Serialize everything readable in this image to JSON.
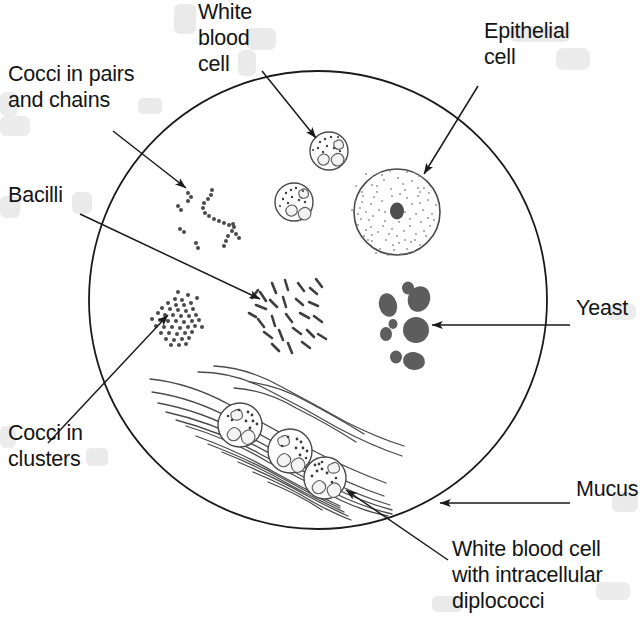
{
  "figure": {
    "kind": "microscopy-smear-diagram",
    "title_visible": false,
    "field_shape": "circle",
    "background_color": "#ffffff",
    "ink_color": "#1a1a1a"
  },
  "labels": [
    {
      "id": "white-blood-cell",
      "lines": [
        "White",
        "blood",
        "cell"
      ],
      "text": "White blood cell",
      "align": "left",
      "x": 198,
      "y": 19,
      "line_height": 26,
      "leader": {
        "from": [
          262,
          71
        ],
        "to": [
          318,
          140
        ],
        "arrow": true
      }
    },
    {
      "id": "cocci-in-pairs-and-chains",
      "lines": [
        "Cocci in pairs",
        "and chains"
      ],
      "text": "Cocci in pairs and chains",
      "align": "left",
      "x": 8,
      "y": 81,
      "line_height": 26,
      "leader": {
        "from": [
          113,
          131
        ],
        "to": [
          188,
          190
        ],
        "arrow": true
      }
    },
    {
      "id": "epithelial-cell",
      "lines": [
        "Epithelial",
        "cell"
      ],
      "text": "Epithelial cell",
      "align": "left",
      "x": 484,
      "y": 38,
      "line_height": 26,
      "leader": {
        "from": [
          478,
          86
        ],
        "to": [
          422,
          176
        ],
        "arrow": true
      }
    },
    {
      "id": "bacilli",
      "lines": [
        "Bacilli"
      ],
      "text": "Bacilli",
      "align": "left",
      "x": 8,
      "y": 202,
      "line_height": 26,
      "leader": {
        "from": [
          80,
          214
        ],
        "to": [
          262,
          300
        ],
        "arrow": true
      }
    },
    {
      "id": "yeast",
      "lines": [
        "Yeast"
      ],
      "text": "Yeast",
      "align": "left",
      "x": 576,
      "y": 315,
      "line_height": 26,
      "leader": {
        "from": [
          570,
          325
        ],
        "to": [
          430,
          325
        ],
        "arrow": true
      }
    },
    {
      "id": "cocci-in-clusters",
      "lines": [
        "Cocci in",
        "clusters"
      ],
      "text": "Cocci in clusters",
      "align": "left",
      "x": 8,
      "y": 440,
      "line_height": 26,
      "leader": {
        "from": [
          48,
          443
        ],
        "to": [
          166,
          313
        ],
        "arrow": true
      }
    },
    {
      "id": "mucus",
      "lines": [
        "Mucus"
      ],
      "text": "Mucus",
      "align": "left",
      "x": 576,
      "y": 496,
      "line_height": 26,
      "leader": {
        "from": [
          570,
          503
        ],
        "to": [
          437,
          503
        ],
        "arrow": true
      }
    },
    {
      "id": "white-blood-cell-with-intracellular-diplococci",
      "lines": [
        "White blood cell",
        "with intracellular",
        "diplococci"
      ],
      "text": "White blood cell with intracellular diplococci",
      "align": "left",
      "x": 452,
      "y": 556,
      "line_height": 26,
      "leader": {
        "from": [
          448,
          560
        ],
        "to": [
          344,
          488
        ],
        "arrow": true
      }
    }
  ],
  "field": {
    "center": [
      318,
      300
    ],
    "radius": 229,
    "stroke_width": 1.8
  },
  "specimens": {
    "epithelial_cell": {
      "center": [
        397,
        212
      ],
      "radius": 43,
      "nucleus": {
        "center": [
          397,
          211
        ],
        "rx": 7,
        "ry": 8.5,
        "color": "#4d4d4d"
      },
      "stipple_count": 150,
      "stipple_color": "#8a8a8a"
    },
    "white_blood_cells_free": [
      {
        "center": [
          329,
          151
        ],
        "radius": 19
      },
      {
        "center": [
          294,
          202
        ],
        "radius": 19
      }
    ],
    "white_blood_cells_in_mucus": [
      {
        "center": [
          240,
          425
        ],
        "radius": 22
      },
      {
        "center": [
          290,
          451
        ],
        "radius": 22
      },
      {
        "center": [
          325,
          478
        ],
        "radius": 21
      }
    ],
    "yeast_cells": {
      "color": "#5d5d5d",
      "cells": [
        {
          "cx": 388,
          "cy": 305,
          "rx": 9,
          "ry": 12,
          "rot": -15
        },
        {
          "cx": 419,
          "cy": 299,
          "rx": 11,
          "ry": 13,
          "rot": 20
        },
        {
          "cx": 408,
          "cy": 288,
          "rx": 6,
          "ry": 6.5,
          "rot": 0
        },
        {
          "cx": 416,
          "cy": 330,
          "rx": 13,
          "ry": 13,
          "rot": 0
        },
        {
          "cx": 386,
          "cy": 334,
          "rx": 6,
          "ry": 7,
          "rot": 0
        },
        {
          "cx": 393,
          "cy": 324,
          "rx": 4.5,
          "ry": 5,
          "rot": 0
        },
        {
          "cx": 414,
          "cy": 361,
          "rx": 11,
          "ry": 9,
          "rot": 10
        },
        {
          "cx": 396,
          "cy": 357,
          "rx": 6,
          "ry": 6.5,
          "rot": 0
        }
      ]
    },
    "cocci_clusters": {
      "center": [
        175,
        320
      ],
      "dot_count": 46,
      "dot_radius": 2.0,
      "spread": 24,
      "color": "#4a4a4a"
    },
    "cocci_chains": {
      "color": "#4a4a4a",
      "dot_radius": 2.0,
      "chains": 4,
      "pairs": 4
    },
    "bacilli": {
      "center": [
        288,
        310
      ],
      "count": 26,
      "rod_length": 11,
      "rod_width": 2.6,
      "color": "#3f3f3f"
    },
    "mucus": {
      "strand_count": 16,
      "color": "#4a4a4a",
      "direction": "upper-left to lower-right"
    }
  }
}
